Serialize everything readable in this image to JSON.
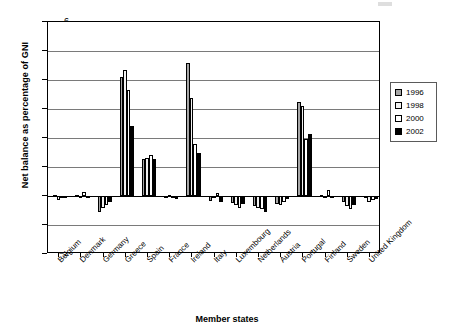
{
  "chart_data": {
    "type": "bar",
    "title": "",
    "xlabel": "Member states",
    "ylabel": "Net balance as percentage of GNI",
    "ylim": [
      -2,
      6
    ],
    "yticks": [
      6,
      5,
      4,
      3,
      2,
      1,
      0,
      -1,
      -2
    ],
    "ytick_labels": [
      "6",
      "5",
      "4",
      "3",
      "2",
      "1",
      "0",
      "−1",
      "−2"
    ],
    "grid": true,
    "legend_position": "right",
    "categories": [
      "Belgium",
      "Denmark",
      "Germany",
      "Greece",
      "Spain",
      "France",
      "Ireland",
      "Italy",
      "Luxembourg",
      "Netherlands",
      "Austria",
      "Portugal",
      "Finland",
      "Sweden",
      "United Kingdom"
    ],
    "series": [
      {
        "name": "1996",
        "color": "#a6a6a6",
        "values": [
          0.05,
          0.02,
          -0.55,
          4.1,
          1.28,
          -0.03,
          4.6,
          -0.18,
          -0.25,
          -0.35,
          -0.28,
          3.25,
          0.03,
          -0.22,
          -0.05
        ]
      },
      {
        "name": "1998",
        "color": "#f2f2f2",
        "values": [
          -0.15,
          -0.05,
          -0.4,
          4.35,
          1.3,
          0.03,
          3.38,
          -0.08,
          -0.32,
          -0.42,
          -0.3,
          3.1,
          -0.05,
          -0.35,
          -0.2
        ]
      },
      {
        "name": "2000",
        "color": "#ffffff",
        "values": [
          -0.02,
          0.15,
          -0.3,
          3.65,
          1.4,
          -0.02,
          1.78,
          0.1,
          -0.4,
          -0.45,
          -0.22,
          1.95,
          0.22,
          -0.45,
          -0.15
        ]
      },
      {
        "name": "2002",
        "color": "#000000",
        "values": [
          -0.08,
          -0.08,
          -0.22,
          2.4,
          1.28,
          -0.12,
          1.5,
          -0.2,
          -0.28,
          -0.55,
          -0.12,
          2.15,
          -0.02,
          -0.3,
          -0.12
        ]
      }
    ]
  },
  "legend": {
    "entries": [
      {
        "label": "1996",
        "color": "#a6a6a6"
      },
      {
        "label": "1998",
        "color": "#f2f2f2"
      },
      {
        "label": "2000",
        "color": "#ffffff"
      },
      {
        "label": "2002",
        "color": "#000000"
      }
    ]
  },
  "axes": {
    "y_title": "Net balance as percentage of GNI",
    "x_title": "Member states"
  }
}
